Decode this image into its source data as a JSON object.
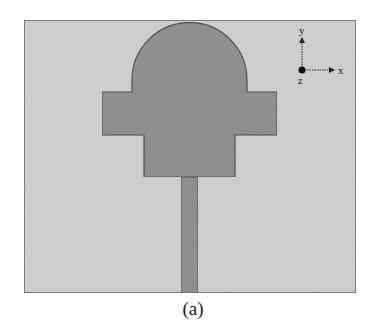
{
  "figure": {
    "caption": "(a)",
    "colors": {
      "substrate_fill": "#cfcfcf",
      "substrate_stroke": "#5a5a5a",
      "patch_fill": "#8a8a8a",
      "patch_stroke": "#3e3e3e",
      "axis_color": "#222222"
    },
    "axes": {
      "x_label": "x",
      "y_label": "y",
      "z_label": "z"
    }
  }
}
